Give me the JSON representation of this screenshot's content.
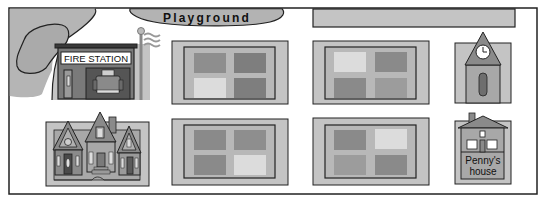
{
  "map": {
    "playground_label": "Playground",
    "fire_station_label": "FIRE STATION",
    "penny_house_label_line1": "Penny's",
    "penny_house_label_line2": "house",
    "colors": {
      "frame": "#222222",
      "park": "#b5b5b5",
      "block_outer": "#c4c4c4",
      "block_inner": "#b8b8b8",
      "lot_dark": "#8a8a8a",
      "lot_mid": "#9c9c9c",
      "lot_light": "#dcdcdc",
      "building_dark": "#6e6e6e",
      "building_mid": "#9a9a9a"
    },
    "places": [
      {
        "name": "Playground"
      },
      {
        "name": "Fire station"
      },
      {
        "name": "Houses"
      },
      {
        "name": "Clock tower"
      },
      {
        "name": "Penny's house"
      }
    ]
  }
}
